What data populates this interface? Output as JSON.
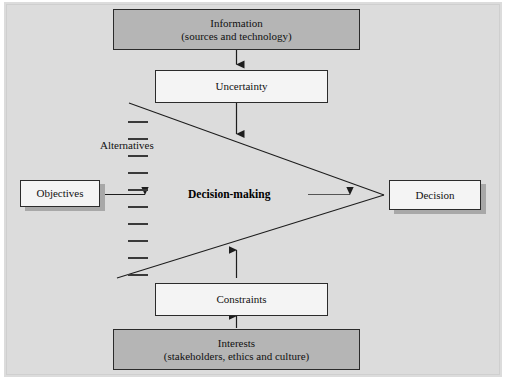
{
  "figure": {
    "background_color": "#dcdcdc",
    "page_color": "#ffffff",
    "dark_box_color": "#b5b5b5",
    "light_box_color": "#f4f4f4",
    "line_color": "#2b2b2b",
    "shadow_color": "#a8a8a8"
  },
  "nodes": {
    "information": {
      "line1": "Information",
      "line2": "(sources and technology)",
      "style": "dark"
    },
    "uncertainty": {
      "line1": "Uncertainty",
      "style": "light"
    },
    "objectives": {
      "line1": "Objectives",
      "style": "light-shadow"
    },
    "decision": {
      "line1": "Decision",
      "style": "light-shadow"
    },
    "constraints": {
      "line1": "Constraints",
      "style": "light"
    },
    "interests": {
      "line1": "Interests",
      "line2": "(stakeholders, ethics and culture)",
      "style": "dark"
    }
  },
  "labels": {
    "center": "Decision-making",
    "alternatives": "Alternatives"
  },
  "dashes": {
    "count": 10,
    "x": 128,
    "width": 20,
    "spacing": 17,
    "start_y": 121
  },
  "connectors": [
    {
      "name": "information-to-uncertainty",
      "from": "information",
      "to": "uncertainty",
      "arrow": true
    },
    {
      "name": "uncertainty-to-core",
      "from": "uncertainty",
      "to": "decision-making",
      "arrow": true
    },
    {
      "name": "objectives-to-core",
      "from": "objectives",
      "to": "alternatives",
      "arrow": true
    },
    {
      "name": "core-to-decision",
      "from": "decision-making",
      "to": "decision",
      "arrow": true
    },
    {
      "name": "constraints-to-core",
      "from": "constraints",
      "to": "decision-making",
      "arrow": true
    },
    {
      "name": "interests-to-constraints",
      "from": "interests",
      "to": "constraints",
      "arrow": true
    },
    {
      "name": "funnel-upper-edge",
      "from": "alternatives-top",
      "to": "decision-apex",
      "arrow": false
    },
    {
      "name": "funnel-lower-edge",
      "from": "alternatives-bottom",
      "to": "decision-apex",
      "arrow": false
    }
  ]
}
